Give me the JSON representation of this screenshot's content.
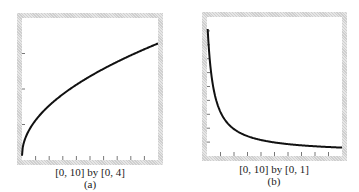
{
  "chart_data": [
    {
      "type": "line",
      "panel": "(a)",
      "caption": "[0, 10] by [0, 4]",
      "xlim": [
        0,
        10
      ],
      "ylim": [
        0,
        4
      ],
      "function": "y = sqrt(x)",
      "x": [
        0,
        0.1,
        0.5,
        1,
        2,
        3,
        4,
        5,
        6,
        7,
        8,
        9,
        10
      ],
      "y": [
        0,
        0.32,
        0.71,
        1.0,
        1.41,
        1.73,
        2.0,
        2.24,
        2.45,
        2.65,
        2.83,
        3.0,
        3.16
      ],
      "x_ticks": 10,
      "y_ticks": 4,
      "grid": false
    },
    {
      "type": "line",
      "panel": "(b)",
      "caption": "[0, 10] by [0, 1]",
      "xlim": [
        0,
        10
      ],
      "ylim": [
        0,
        1
      ],
      "function": "decreasing curve, approx y = 1/(x+1) shape",
      "x": [
        0,
        0.5,
        1,
        2,
        3,
        4,
        5,
        6,
        7,
        8,
        9,
        10
      ],
      "y": [
        0.98,
        0.66,
        0.5,
        0.33,
        0.25,
        0.2,
        0.17,
        0.14,
        0.125,
        0.11,
        0.1,
        0.09
      ],
      "x_ticks": 10,
      "y_ticks": 10,
      "grid": false
    }
  ],
  "panels": {
    "a": {
      "range_label": "[0, 10] by [0, 4]",
      "label": "(a)"
    },
    "b": {
      "range_label": "[0, 10] by [0, 1]",
      "label": "(b)"
    }
  }
}
